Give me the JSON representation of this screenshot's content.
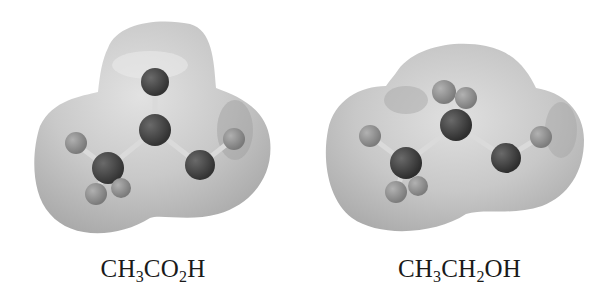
{
  "figures": [
    {
      "name": "acetic-acid",
      "caption": {
        "parts": [
          {
            "t": "CH"
          },
          {
            "s": "3"
          },
          {
            "t": "CO"
          },
          {
            "s": "2"
          },
          {
            "t": "H"
          }
        ]
      },
      "caption_text": "CH3CO2H"
    },
    {
      "name": "ethanol",
      "caption": {
        "parts": [
          {
            "t": "CH"
          },
          {
            "s": "3"
          },
          {
            "t": "CH"
          },
          {
            "s": "2"
          },
          {
            "t": "OH"
          }
        ]
      },
      "caption_text": "CH3CH2OH"
    }
  ],
  "colors": {
    "surface": "#c4c4c4",
    "surface_light": "#dcdcdc",
    "surface_dark": "#a8a8a8",
    "heavy_atom": "#4a4a4a",
    "oxygen_atom": "#555555",
    "hydrogen_atom": "#8c8c8c",
    "bond": "#d8d8d8",
    "caption_text": "#1a1a1a"
  }
}
